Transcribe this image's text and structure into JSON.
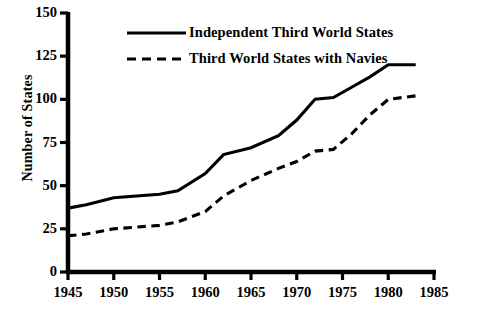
{
  "chart_data": {
    "type": "line",
    "title": "",
    "xlabel": "",
    "ylabel": "Number of States",
    "xlim": [
      1945,
      1985
    ],
    "ylim": [
      0,
      150
    ],
    "xticks": [
      1945,
      1950,
      1955,
      1960,
      1965,
      1970,
      1975,
      1980,
      1985
    ],
    "yticks": [
      0,
      25,
      50,
      75,
      100,
      125,
      150
    ],
    "grid": false,
    "legend_position": "top-center",
    "series": [
      {
        "name": "Independent Third World States",
        "style": "solid",
        "color": "#000000",
        "x": [
          1945,
          1947,
          1950,
          1955,
          1957,
          1960,
          1962,
          1965,
          1968,
          1970,
          1972,
          1974,
          1976,
          1978,
          1980,
          1983
        ],
        "values": [
          37,
          39,
          43,
          45,
          47,
          57,
          68,
          72,
          79,
          88,
          100,
          101,
          107,
          113,
          120,
          120
        ]
      },
      {
        "name": "Third World States with Navies",
        "style": "dashed",
        "color": "#000000",
        "x": [
          1945,
          1947,
          1950,
          1955,
          1957,
          1960,
          1962,
          1965,
          1968,
          1970,
          1972,
          1974,
          1976,
          1978,
          1980,
          1983
        ],
        "values": [
          21,
          22,
          25,
          27,
          29,
          35,
          44,
          53,
          60,
          64,
          70,
          71,
          80,
          91,
          100,
          102
        ]
      }
    ]
  },
  "axis": {
    "ylabel": "Number of States",
    "ytick_labels": [
      "150",
      "125",
      "100",
      "75",
      "50",
      "25",
      "0"
    ],
    "xtick_labels": [
      "1945",
      "1950",
      "1955",
      "1960",
      "1965",
      "1970",
      "1975",
      "1980",
      "1985"
    ]
  },
  "legend": {
    "entries": [
      {
        "label": "Independent Third World States",
        "style": "solid"
      },
      {
        "label": "Third World States with Navies",
        "style": "dashed"
      }
    ]
  },
  "colors": {
    "ink": "#000000",
    "background": "#ffffff"
  }
}
